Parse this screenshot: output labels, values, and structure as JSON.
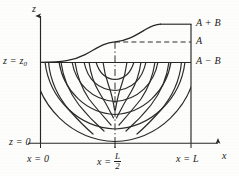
{
  "figure": {
    "kind": "seepage-flow-net-diagram",
    "axes": {
      "vertical_axis_label": "z",
      "horizontal_axis_label": "x"
    },
    "left_labels": [
      {
        "id": "z-top",
        "text_main": "z = z",
        "text_sub": "0"
      },
      {
        "id": "z-zero",
        "text": "z = 0"
      }
    ],
    "bottom_labels": [
      {
        "id": "x-zero",
        "text": "x = 0"
      },
      {
        "id": "x-half",
        "prefix": "x = ",
        "numerator": "L",
        "denominator": "2"
      },
      {
        "id": "x-L",
        "text": "x = L"
      }
    ],
    "right_labels": [
      {
        "id": "a-plus-b",
        "text": "A + B"
      },
      {
        "id": "a",
        "text": "A"
      },
      {
        "id": "a-minus-b",
        "text": "A − B"
      }
    ],
    "colors": {
      "ink": "#262626",
      "paper": "#fdfdfb",
      "curve": "#2b2b2b",
      "dashed": "#2f2f2f"
    },
    "geometry": {
      "domain_left_x": 40,
      "domain_right_x": 191,
      "domain_top_z0_y": 62,
      "domain_bottom_y": 143,
      "level_A_y": 42,
      "level_A_plus_B_y": 24,
      "midline_x": 115
    },
    "curves": {
      "free_surface_description": "sigmoid water table rising from z=z0 at x=0 to A+B at x=L",
      "equipotential_count": 6,
      "streamline_count": 5
    }
  }
}
